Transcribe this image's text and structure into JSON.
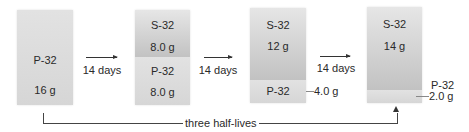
{
  "diagram": {
    "stages": [
      {
        "p32": {
          "label": "P-32",
          "mass": "16 g"
        }
      },
      {
        "s32": {
          "label": "S-32",
          "mass": "8.0 g"
        },
        "p32": {
          "label": "P-32",
          "mass": "8.0 g"
        }
      },
      {
        "s32": {
          "label": "S-32",
          "mass": "12 g"
        },
        "p32": {
          "label": "P-32",
          "mass": "4.0 g"
        }
      },
      {
        "s32": {
          "label": "S-32",
          "mass": "14 g"
        },
        "p32": {
          "label": "P-32",
          "mass": "2.0 g"
        }
      }
    ],
    "transitions": [
      {
        "label": "14 days"
      },
      {
        "label": "14 days"
      },
      {
        "label": "14 days"
      }
    ],
    "bracket": {
      "label": "three half-lives"
    },
    "colors": {
      "p32_fill": "#dcdcdc",
      "s32_fill_top": "#e6e6e6",
      "s32_fill_bottom": "#c2c2c2",
      "line": "#333333"
    }
  }
}
